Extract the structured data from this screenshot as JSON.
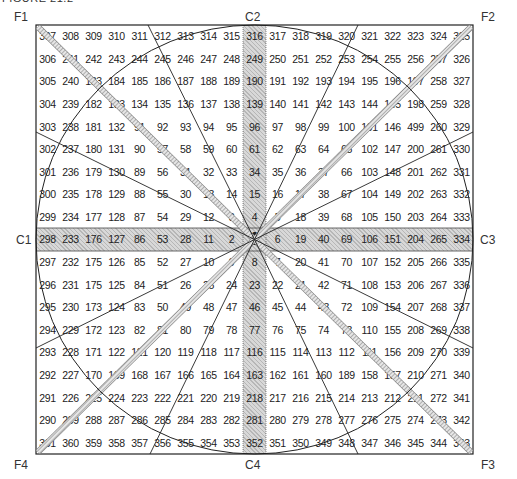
{
  "figure": {
    "title": "FIGURE 21.2",
    "corner_labels": {
      "F1": "F1",
      "F2": "F2",
      "F3": "F3",
      "F4": "F4",
      "C1": "C1",
      "C2": "C2",
      "C3": "C3",
      "C4": "C4"
    },
    "colors": {
      "band": "#d8d8d8",
      "line": "#222222",
      "hatch": "#999999"
    },
    "grid_rows": [
      [
        "307",
        "308",
        "309",
        "310",
        "311",
        "312",
        "313",
        "314",
        "315",
        "316",
        "317",
        "318",
        "319",
        "320",
        "321",
        "322",
        "323",
        "324",
        "325"
      ],
      [
        "306",
        "241",
        "242",
        "243",
        "244",
        "245",
        "246",
        "247",
        "248",
        "249",
        "250",
        "251",
        "252",
        "253",
        "254",
        "255",
        "256",
        "257",
        "326"
      ],
      [
        "305",
        "240",
        "183",
        "184",
        "185",
        "186",
        "187",
        "188",
        "189",
        "190",
        "191",
        "192",
        "193",
        "194",
        "195",
        "196",
        "197",
        "258",
        "327"
      ],
      [
        "304",
        "239",
        "182",
        "133",
        "134",
        "135",
        "136",
        "137",
        "138",
        "139",
        "140",
        "141",
        "142",
        "143",
        "144",
        "145",
        "198",
        "259",
        "328"
      ],
      [
        "303",
        "238",
        "181",
        "132",
        "91",
        "92",
        "93",
        "94",
        "95",
        "96",
        "97",
        "98",
        "99",
        "100",
        "101",
        "146",
        "499",
        "260",
        "329"
      ],
      [
        "302",
        "237",
        "180",
        "131",
        "90",
        "57",
        "58",
        "59",
        "60",
        "61",
        "62",
        "63",
        "64",
        "65",
        "102",
        "147",
        "200",
        "261",
        "330"
      ],
      [
        "301",
        "236",
        "179",
        "130",
        "89",
        "56",
        "31",
        "32",
        "33",
        "34",
        "35",
        "36",
        "37",
        "66",
        "103",
        "148",
        "201",
        "262",
        "331"
      ],
      [
        "300",
        "235",
        "178",
        "129",
        "88",
        "55",
        "30",
        "13",
        "14",
        "15",
        "16",
        "17",
        "38",
        "67",
        "104",
        "149",
        "202",
        "263",
        "332"
      ],
      [
        "299",
        "234",
        "177",
        "128",
        "87",
        "54",
        "29",
        "12",
        "3",
        "4",
        "5",
        "18",
        "39",
        "68",
        "105",
        "150",
        "203",
        "264",
        "333"
      ],
      [
        "298",
        "233",
        "176",
        "127",
        "86",
        "53",
        "28",
        "11",
        "2",
        "1",
        "6",
        "19",
        "40",
        "69",
        "106",
        "151",
        "204",
        "265",
        "334"
      ],
      [
        "297",
        "232",
        "175",
        "126",
        "85",
        "52",
        "27",
        "10",
        "9",
        "8",
        "7",
        "20",
        "41",
        "70",
        "107",
        "152",
        "205",
        "266",
        "335"
      ],
      [
        "296",
        "231",
        "175",
        "125",
        "84",
        "51",
        "26",
        "25",
        "24",
        "23",
        "22",
        "21",
        "42",
        "71",
        "108",
        "153",
        "206",
        "267",
        "336"
      ],
      [
        "295",
        "230",
        "173",
        "124",
        "83",
        "50",
        "49",
        "48",
        "47",
        "46",
        "45",
        "44",
        "43",
        "72",
        "109",
        "154",
        "207",
        "268",
        "337"
      ],
      [
        "294",
        "229",
        "172",
        "123",
        "82",
        "81",
        "80",
        "79",
        "78",
        "77",
        "76",
        "75",
        "74",
        "73",
        "110",
        "155",
        "208",
        "269",
        "338"
      ],
      [
        "293",
        "228",
        "171",
        "122",
        "121",
        "120",
        "119",
        "118",
        "117",
        "116",
        "115",
        "114",
        "113",
        "112",
        "111",
        "156",
        "209",
        "270",
        "339"
      ],
      [
        "292",
        "227",
        "170",
        "169",
        "168",
        "167",
        "166",
        "165",
        "164",
        "163",
        "162",
        "161",
        "160",
        "189",
        "158",
        "157",
        "210",
        "271",
        "340"
      ],
      [
        "291",
        "226",
        "225",
        "224",
        "223",
        "222",
        "221",
        "220",
        "219",
        "218",
        "217",
        "216",
        "215",
        "214",
        "213",
        "212",
        "211",
        "272",
        "341"
      ],
      [
        "290",
        "289",
        "288",
        "287",
        "286",
        "285",
        "284",
        "283",
        "282",
        "281",
        "280",
        "279",
        "278",
        "277",
        "276",
        "275",
        "274",
        "273",
        "342"
      ],
      [
        "361",
        "360",
        "359",
        "358",
        "357",
        "356",
        "355",
        "354",
        "353",
        "352",
        "351",
        "350",
        "349",
        "348",
        "347",
        "346",
        "345",
        "344",
        "343"
      ]
    ]
  }
}
